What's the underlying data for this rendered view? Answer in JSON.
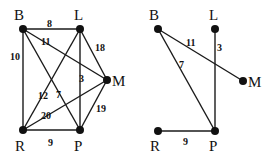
{
  "graphs": [
    {
      "id": "left",
      "description": "Complete weighted graph",
      "nodes": [
        {
          "name": "B",
          "x": 23,
          "y": 29,
          "lx": 14,
          "ly": 20
        },
        {
          "name": "L",
          "x": 80,
          "y": 29,
          "lx": 74,
          "ly": 20
        },
        {
          "name": "M",
          "x": 107,
          "y": 80,
          "lx": 112,
          "ly": 86
        },
        {
          "name": "R",
          "x": 23,
          "y": 130,
          "lx": 15,
          "ly": 151
        },
        {
          "name": "P",
          "x": 80,
          "y": 130,
          "lx": 74,
          "ly": 151
        }
      ],
      "edges": [
        {
          "from": "B",
          "to": "L",
          "weight": "8",
          "wx": 47,
          "wy": 27
        },
        {
          "from": "B",
          "to": "M",
          "weight": "11",
          "wx": 41,
          "wy": 45
        },
        {
          "from": "B",
          "to": "R",
          "weight": "10",
          "wx": 10,
          "wy": 60
        },
        {
          "from": "B",
          "to": "P",
          "weight": "7",
          "wx": 56,
          "wy": 98
        },
        {
          "from": "L",
          "to": "M",
          "weight": "18",
          "wx": 95,
          "wy": 51
        },
        {
          "from": "L",
          "to": "P",
          "weight": "3",
          "wx": 79,
          "wy": 82
        },
        {
          "from": "L",
          "to": "R",
          "weight": "12",
          "wx": 38,
          "wy": 99
        },
        {
          "from": "M",
          "to": "R",
          "weight": "20",
          "wx": 41,
          "wy": 119
        },
        {
          "from": "M",
          "to": "P",
          "weight": "19",
          "wx": 96,
          "wy": 112
        },
        {
          "from": "R",
          "to": "P",
          "weight": "9",
          "wx": 48,
          "wy": 146
        }
      ]
    },
    {
      "id": "right",
      "description": "Minimum spanning tree",
      "nodes": [
        {
          "name": "B",
          "x": 158,
          "y": 29,
          "lx": 149,
          "ly": 20
        },
        {
          "name": "L",
          "x": 215,
          "y": 29,
          "lx": 209,
          "ly": 20
        },
        {
          "name": "M",
          "x": 243,
          "y": 81,
          "lx": 248,
          "ly": 87
        },
        {
          "name": "R",
          "x": 158,
          "y": 131,
          "lx": 150,
          "ly": 151
        },
        {
          "name": "P",
          "x": 215,
          "y": 131,
          "lx": 209,
          "ly": 151
        }
      ],
      "edges": [
        {
          "from": "B",
          "to": "M",
          "weight": "11",
          "wx": 186,
          "wy": 46
        },
        {
          "from": "B",
          "to": "P",
          "weight": "7",
          "wx": 179,
          "wy": 68
        },
        {
          "from": "L",
          "to": "P",
          "weight": "3",
          "wx": 217,
          "wy": 51
        },
        {
          "from": "R",
          "to": "P",
          "weight": "9",
          "wx": 183,
          "wy": 145
        }
      ]
    }
  ]
}
